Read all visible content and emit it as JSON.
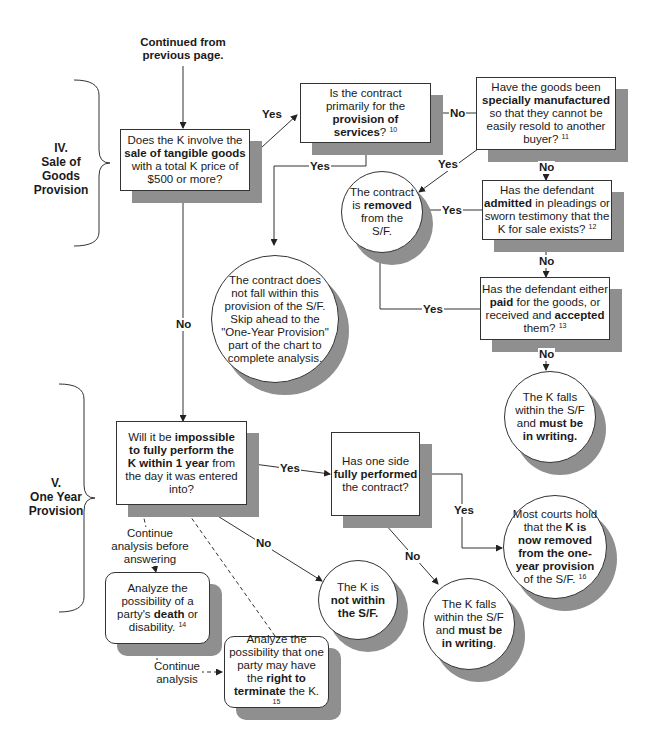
{
  "start_label": {
    "line1": "Continued from",
    "line2": "previous page."
  },
  "sections": [
    {
      "numeral": "IV.",
      "name_lines": [
        "Sale of",
        "Goods",
        "Provision"
      ]
    },
    {
      "numeral": "V.",
      "name_lines": [
        "One Year",
        "Provision"
      ]
    }
  ],
  "nodes": {
    "q_tangible_goods": {
      "pre": "Does the K involve the ",
      "bold": "sale of tangible goods",
      "post": " with a total K price of $500 or more?",
      "note": ""
    },
    "q_services": {
      "pre": "Is the contract primarily for the ",
      "bold": "provision of services",
      "post": "? ",
      "note": "10"
    },
    "q_specially_manufactured": {
      "pre": "Have the goods been ",
      "bold": "specially manufactured",
      "post": " so that they cannot be easily resold to another buyer? ",
      "note": "11"
    },
    "q_admitted": {
      "pre": "Has the defendant ",
      "bold": "admitted",
      "post": " in pleadings or sworn testimony that the K for sale exists? ",
      "note": "12"
    },
    "q_paid_accepted": {
      "pre": "Has the defendant either ",
      "bold1": "paid",
      "mid": " for the goods, or received and ",
      "bold2": "accepted",
      "post": " them? ",
      "note": "13"
    },
    "r_removed": {
      "pre": "The contract is ",
      "bold": "removed",
      "post": " from the S/F."
    },
    "r_not_within_provision": {
      "text": "The contract does not fall within this provision of the S/F. Skip ahead to the \"One-Year Provision\" part of the chart to complete analysis."
    },
    "r_must_write_1": {
      "pre": "The K falls within the S/F and ",
      "bold": "must be in writing."
    },
    "q_one_year": {
      "pre": "Will it be ",
      "bold": "impossible to fully perform the K within 1 year",
      "post": " from the day it was entered into?"
    },
    "q_fully_performed": {
      "pre": "Has one side ",
      "bold": "fully performed",
      "post": " the contract?"
    },
    "r_courts_hold": {
      "pre": "Most courts hold that the ",
      "bold": "K is now removed from the one-year provision",
      "post": " of the S/F. ",
      "note": "16"
    },
    "r_not_within_sf": {
      "pre": "The K is ",
      "bold": "not within the S/F."
    },
    "r_must_write_2": {
      "pre": "The K falls within the S/F and ",
      "bold": "must be in writing",
      "post": "."
    },
    "a_death": {
      "pre": "Analyze the possibility of a party's ",
      "bold": "death",
      "post": " or disability. ",
      "note": "14"
    },
    "a_terminate": {
      "pre": "Analyze the possibility that one party may have the ",
      "bold": "right to terminate",
      "post": " the K. ",
      "note": "15"
    }
  },
  "edge_labels": {
    "yes_services": "Yes",
    "no_manufactured": "No",
    "yes_services_down": "Yes",
    "yes_manufactured": "Yes",
    "no_admitted": "No",
    "yes_admitted": "Yes",
    "no_paid": "No",
    "yes_paid": "Yes",
    "no_paid_result": "No",
    "no_goods": "No",
    "yes_one_year": "Yes",
    "no_one_year": "No",
    "yes_performed": "Yes",
    "no_performed": "No",
    "continue_before": "Continue analysis before answering",
    "continue_analysis_l1": "Continue",
    "continue_analysis_l2": "analysis"
  }
}
